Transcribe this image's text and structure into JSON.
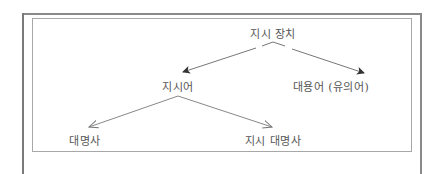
{
  "diagram": {
    "type": "tree",
    "nodes": {
      "root": "지시 장치",
      "left": "지시어",
      "right": "대용어 (유의어)",
      "left_left": "대명사",
      "left_right": "지시 대명사"
    },
    "edges": [
      {
        "from": "지시 장치",
        "to": "지시어",
        "arrow": "filled"
      },
      {
        "from": "지시 장치",
        "to": "대용어 (유의어)",
        "arrow": "filled"
      },
      {
        "from": "지시어",
        "to": "대명사",
        "arrow": "open"
      },
      {
        "from": "지시어",
        "to": "지시 대명사",
        "arrow": "open"
      }
    ],
    "colors": {
      "line": "#707070",
      "text": "#555555",
      "frame": "#8a8a8a"
    }
  }
}
